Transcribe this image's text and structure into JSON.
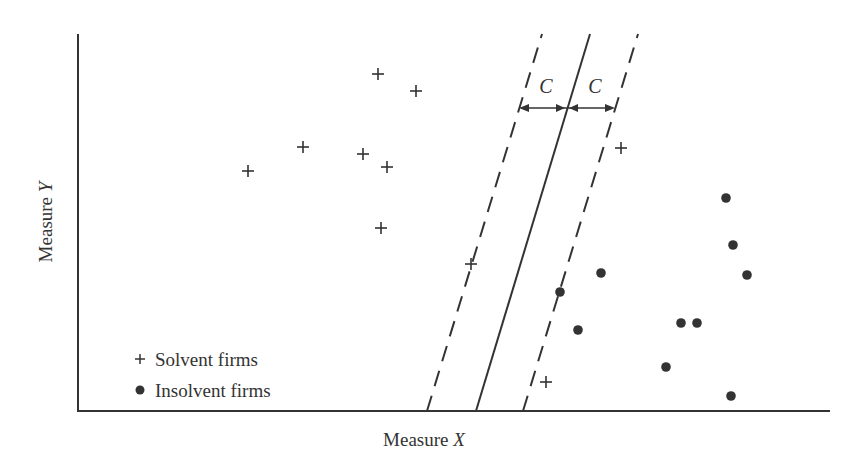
{
  "chart_data": {
    "type": "scatter",
    "title": "",
    "xlabel_prefix": "Measure ",
    "xlabel_var": "X",
    "ylabel_prefix": "Measure ",
    "ylabel_var": "Y",
    "margin_label": "C",
    "legend": {
      "position": "lower-left",
      "entries": [
        {
          "marker": "+",
          "label": "Solvent firms"
        },
        {
          "marker": "●",
          "label": "Insolvent firms"
        }
      ]
    },
    "series": [
      {
        "name": "Solvent firms",
        "marker": "plus",
        "points_px": [
          [
            378,
            74
          ],
          [
            416,
            91
          ],
          [
            303,
            147
          ],
          [
            363,
            154
          ],
          [
            387,
            167
          ],
          [
            248,
            171
          ],
          [
            381,
            228
          ],
          [
            471,
            264
          ],
          [
            621,
            148
          ],
          [
            546,
            382
          ]
        ]
      },
      {
        "name": "Insolvent firms",
        "marker": "dot",
        "points_px": [
          [
            726,
            198
          ],
          [
            733,
            245
          ],
          [
            747,
            275
          ],
          [
            601,
            273
          ],
          [
            560,
            292
          ],
          [
            578,
            330
          ],
          [
            681,
            323
          ],
          [
            697,
            323
          ],
          [
            666,
            367
          ],
          [
            731,
            396
          ]
        ]
      }
    ],
    "lines": {
      "separator": {
        "style": "solid",
        "from": [
          476,
          411
        ],
        "to": [
          590,
          34
        ]
      },
      "margin_left": {
        "style": "dashed",
        "from": [
          427,
          411
        ],
        "to": [
          542,
          34
        ]
      },
      "margin_right": {
        "style": "dashed",
        "from": [
          523,
          411
        ],
        "to": [
          638,
          34
        ]
      }
    },
    "grid": false,
    "axes_ticks": false
  }
}
